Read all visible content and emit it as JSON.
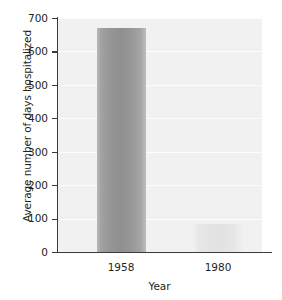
{
  "chart_data": {
    "type": "bar",
    "title": "",
    "subtitle": "",
    "xlabel": "Year",
    "ylabel": "Average number of days hospitalized",
    "categories": [
      "1958",
      "1980"
    ],
    "values": [
      670,
      85
    ],
    "series": [
      {
        "name": "Average number of days hospitalized",
        "values": [
          670,
          85
        ]
      }
    ],
    "ylim": [
      0,
      700
    ],
    "ytick_labels": [
      "0",
      "100",
      "200",
      "300",
      "400",
      "500",
      "600",
      "700"
    ],
    "ytick_values": [
      0,
      100,
      200,
      300,
      400,
      500,
      600,
      700
    ],
    "ytick_interval": 100,
    "grid": true,
    "grid_axis": "y",
    "legend": false,
    "legend_position": "none",
    "annotations": [],
    "colors": {
      "plot_background": "#f1f1f1",
      "gridline": "#fdfdfd",
      "axis": "#3b3b3b",
      "text": "#231f20",
      "bar_1958": "#959595",
      "bar_1980": "#e3e3e3",
      "figure_background": "#ffffff"
    }
  },
  "axes": {
    "y": {
      "title": "Average number of days hospitalized",
      "ticks": [
        {
          "label": "700",
          "value": 700
        },
        {
          "label": "600",
          "value": 600
        },
        {
          "label": "500",
          "value": 500
        },
        {
          "label": "400",
          "value": 400
        },
        {
          "label": "300",
          "value": 300
        },
        {
          "label": "200",
          "value": 200
        },
        {
          "label": "100",
          "value": 100
        },
        {
          "label": "0",
          "value": 0
        }
      ]
    },
    "x": {
      "title": "Year",
      "ticks": [
        {
          "label": "1958"
        },
        {
          "label": "1980"
        }
      ]
    }
  },
  "bars": [
    {
      "category": "1958",
      "value": 670,
      "color": "#959595"
    },
    {
      "category": "1980",
      "value": 85,
      "color": "#e3e3e3"
    }
  ]
}
